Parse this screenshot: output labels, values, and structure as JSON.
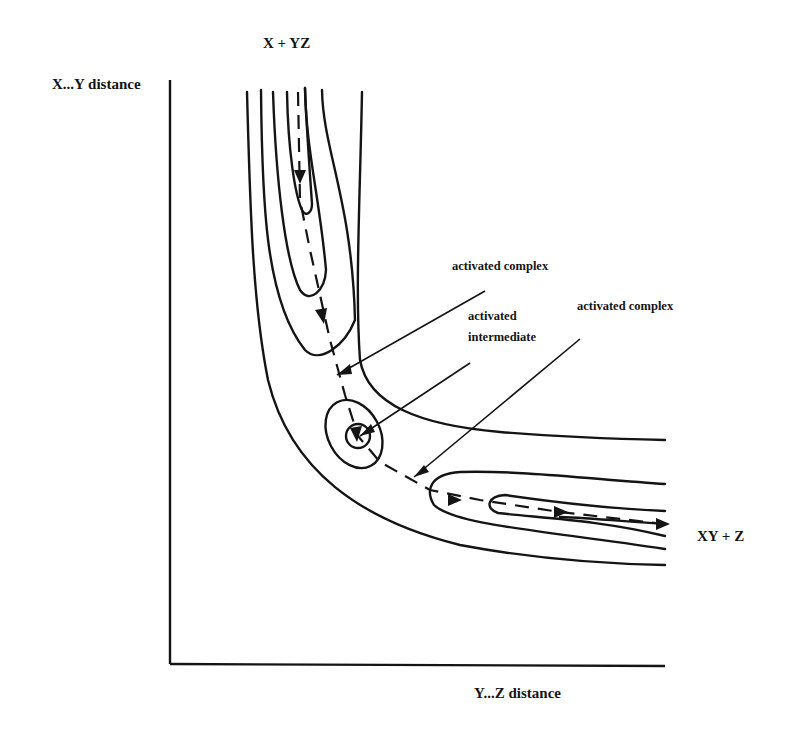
{
  "figure": {
    "type": "potential energy contour diagram",
    "y_axis_label": "X...Y distance",
    "x_axis_label": "Y...Z distance",
    "reactant_label": "X + YZ",
    "product_label": "XY + Z",
    "annotations": [
      {
        "id": "activated-complex-1",
        "text": "activated complex",
        "points_to": "first saddle point"
      },
      {
        "id": "activated-intermediate",
        "text_lines": [
          "activated",
          "intermediate"
        ],
        "points_to": "central well"
      },
      {
        "id": "activated-complex-2",
        "text": "activated complex",
        "points_to": "second saddle point"
      }
    ],
    "color": "#141414"
  }
}
